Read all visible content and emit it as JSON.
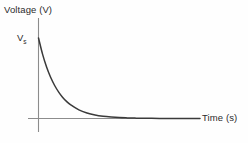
{
  "figure": {
    "y_axis_title": "Voltage (V)",
    "x_axis_title": "Time (s)",
    "initial_value_symbol": "V",
    "initial_value_subscript": "s",
    "curve_color": "#3a3a3a",
    "axis_color": "#8c8c8c",
    "text_color": "#2b2b2b",
    "background_color": "#fefefe"
  },
  "chart_data": {
    "type": "line",
    "title": "",
    "xlabel": "Time (s)",
    "ylabel": "Voltage (V)",
    "xlim": [
      0,
      10
    ],
    "ylim": [
      0,
      1.15
    ],
    "grid": false,
    "legend": null,
    "annotations": [
      {
        "text": "Vs",
        "x": 0,
        "y": 1.0,
        "note": "initial voltage marked on y-axis"
      }
    ],
    "xticks": [],
    "yticks": [],
    "series": [
      {
        "name": "Exponential decay",
        "x": [
          0.0,
          0.25,
          0.5,
          0.75,
          1.0,
          1.25,
          1.5,
          1.75,
          2.0,
          2.5,
          3.0,
          3.5,
          4.0,
          4.5,
          5.0,
          5.5,
          6.0,
          6.5,
          7.0,
          7.5,
          8.0,
          8.5,
          9.0,
          9.5,
          10.0
        ],
        "values": [
          1.0,
          0.8,
          0.64,
          0.512,
          0.41,
          0.328,
          0.262,
          0.21,
          0.168,
          0.107,
          0.069,
          0.044,
          0.028,
          0.018,
          0.011,
          0.0074,
          0.0047,
          0.003,
          0.0019,
          0.0012,
          0.0008,
          0.0005,
          0.0003,
          0.0002,
          0.0001
        ]
      }
    ]
  }
}
